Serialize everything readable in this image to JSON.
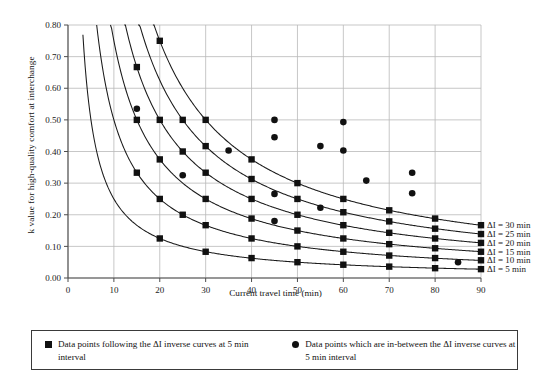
{
  "chart_data": {
    "type": "line",
    "title": "",
    "xlabel": "Current  travel time (min)",
    "ylabel": "k value for high-quality comfort at interchange",
    "xlim": [
      0,
      90
    ],
    "ylim": [
      0.0,
      0.8
    ],
    "xticks": [
      0,
      10,
      20,
      30,
      40,
      50,
      60,
      70,
      80,
      90
    ],
    "xticklabels": [
      "0",
      "10",
      "20",
      "30",
      "40",
      "50",
      "60",
      "70",
      "80",
      "90"
    ],
    "yticks": [
      0.0,
      0.1,
      0.2,
      0.3,
      0.4,
      0.5,
      0.6,
      0.7,
      0.8
    ],
    "yticklabels": [
      "0.00",
      "0.10",
      "0.20",
      "0.30",
      "0.40",
      "0.50",
      "0.60",
      "0.70",
      "0.80"
    ],
    "grid": true,
    "legend_position": "right-of-curves",
    "relation": "k = dI / (2 * T)",
    "series": [
      {
        "name": "ΔI = 5 min",
        "label": "ΔI = 5 min",
        "delta_I": 5,
        "marker": "square",
        "x": [
          15,
          20,
          25,
          30,
          35,
          40,
          45,
          50,
          55,
          60,
          65,
          70,
          75,
          80,
          85,
          90
        ],
        "y": [
          0.167,
          0.125,
          0.1,
          0.083,
          0.071,
          0.063,
          0.056,
          0.05,
          0.045,
          0.042,
          0.038,
          0.036,
          0.033,
          0.031,
          0.029,
          0.028
        ],
        "marker_x": [
          20,
          30,
          40,
          50,
          60,
          70,
          80,
          90
        ],
        "marker_y": [
          0.125,
          0.083,
          0.063,
          0.05,
          0.042,
          0.036,
          0.031,
          0.028
        ]
      },
      {
        "name": "ΔI = 10 min",
        "label": "ΔI = 10 min",
        "delta_I": 10,
        "marker": "square",
        "x": [
          15,
          20,
          25,
          30,
          35,
          40,
          45,
          50,
          55,
          60,
          65,
          70,
          75,
          80,
          85,
          90
        ],
        "y": [
          0.333,
          0.25,
          0.2,
          0.167,
          0.143,
          0.125,
          0.111,
          0.1,
          0.091,
          0.083,
          0.077,
          0.071,
          0.067,
          0.063,
          0.059,
          0.056
        ],
        "marker_x": [
          15,
          20,
          25,
          30,
          40,
          50,
          60,
          70,
          80,
          90
        ],
        "marker_y": [
          0.333,
          0.25,
          0.2,
          0.167,
          0.125,
          0.1,
          0.083,
          0.071,
          0.063,
          0.056
        ]
      },
      {
        "name": "ΔI = 15 min",
        "label": "ΔI = 15 min",
        "delta_I": 15,
        "marker": "square",
        "x": [
          15,
          20,
          25,
          30,
          35,
          40,
          45,
          50,
          55,
          60,
          65,
          70,
          75,
          80,
          85,
          90
        ],
        "y": [
          0.5,
          0.375,
          0.3,
          0.25,
          0.214,
          0.188,
          0.167,
          0.15,
          0.136,
          0.125,
          0.115,
          0.107,
          0.1,
          0.094,
          0.088,
          0.083
        ],
        "marker_x": [
          15,
          20,
          30,
          40,
          50,
          60,
          70,
          80,
          90
        ],
        "marker_y": [
          0.5,
          0.375,
          0.25,
          0.188,
          0.15,
          0.125,
          0.107,
          0.094,
          0.083
        ]
      },
      {
        "name": "ΔI = 20 min",
        "label": "ΔI = 20 min",
        "delta_I": 20,
        "marker": "square",
        "x": [
          15,
          20,
          25,
          30,
          35,
          40,
          45,
          50,
          55,
          60,
          65,
          70,
          75,
          80,
          85,
          90
        ],
        "y": [
          0.667,
          0.5,
          0.4,
          0.333,
          0.286,
          0.25,
          0.222,
          0.2,
          0.182,
          0.167,
          0.154,
          0.143,
          0.133,
          0.125,
          0.118,
          0.111
        ],
        "marker_x": [
          15,
          20,
          25,
          30,
          40,
          50,
          60,
          70,
          80,
          90
        ],
        "marker_y": [
          0.667,
          0.5,
          0.4,
          0.333,
          0.25,
          0.2,
          0.167,
          0.143,
          0.125,
          0.111
        ]
      },
      {
        "name": "ΔI = 25 min",
        "label": "ΔI = 25 min",
        "delta_I": 25,
        "marker": "square",
        "x": [
          16,
          20,
          25,
          30,
          35,
          40,
          45,
          50,
          55,
          60,
          65,
          70,
          75,
          80,
          85,
          90
        ],
        "y": [
          0.781,
          0.625,
          0.5,
          0.417,
          0.357,
          0.313,
          0.278,
          0.25,
          0.227,
          0.208,
          0.192,
          0.179,
          0.167,
          0.156,
          0.147,
          0.139
        ],
        "marker_x": [
          25,
          30,
          40,
          50,
          60,
          70,
          80,
          90
        ],
        "marker_y": [
          0.5,
          0.417,
          0.313,
          0.25,
          0.208,
          0.179,
          0.156,
          0.139
        ]
      },
      {
        "name": "ΔI = 30 min",
        "label": "ΔI = 30 min",
        "delta_I": 30,
        "marker": "square",
        "x": [
          19,
          20,
          25,
          30,
          35,
          40,
          45,
          50,
          55,
          60,
          65,
          70,
          75,
          80,
          85,
          90
        ],
        "y": [
          0.789,
          0.75,
          0.6,
          0.5,
          0.429,
          0.375,
          0.333,
          0.3,
          0.273,
          0.25,
          0.231,
          0.214,
          0.2,
          0.188,
          0.176,
          0.167
        ],
        "marker_x": [
          20,
          30,
          40,
          50,
          60,
          70,
          80,
          90
        ],
        "marker_y": [
          0.75,
          0.5,
          0.375,
          0.3,
          0.25,
          0.214,
          0.188,
          0.167
        ]
      }
    ],
    "scatter_between": {
      "name": "Data points which are in-between the ΔI inverse curves at 5 min interval",
      "marker": "circle",
      "x": [
        15,
        25,
        35,
        45,
        45,
        45,
        45,
        55,
        55,
        60,
        60,
        65,
        75,
        75,
        85
      ],
      "y": [
        0.535,
        0.325,
        0.403,
        0.5,
        0.445,
        0.266,
        0.18,
        0.417,
        0.222,
        0.493,
        0.403,
        0.308,
        0.333,
        0.268,
        0.05
      ]
    },
    "curve_labels": [
      {
        "text": "ΔI = 30 min",
        "at_x": 90,
        "at_y": 0.167
      },
      {
        "text": "ΔI = 25 min",
        "at_x": 90,
        "at_y": 0.139
      },
      {
        "text": "ΔI = 20 min",
        "at_x": 90,
        "at_y": 0.111
      },
      {
        "text": "ΔI = 15 min",
        "at_x": 90,
        "at_y": 0.083
      },
      {
        "text": "ΔI = 10 min",
        "at_x": 90,
        "at_y": 0.056
      },
      {
        "text": "ΔI = 5 min",
        "at_x": 90,
        "at_y": 0.028
      }
    ]
  },
  "legend": {
    "entries": [
      {
        "marker": "square",
        "line1": "Data points following the ΔI inverse curves",
        "line2": "at 5 min interval"
      },
      {
        "marker": "circle",
        "line1": "Data points which are in-between the ΔI inverse",
        "line2": "curves at 5 min interval"
      }
    ]
  },
  "colors": {
    "curve": "#1a1a1a",
    "marker": "#111111",
    "grid": "#b9b9b9",
    "axis": "#4d4d4d",
    "text": "#1a1a1a",
    "background": "#ffffff"
  }
}
